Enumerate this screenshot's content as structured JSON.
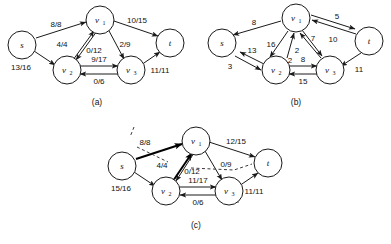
{
  "figure": {
    "panels": [
      {
        "id": "a",
        "caption": "(a)",
        "nodes": [
          {
            "id": "s",
            "label": "s",
            "sub": ""
          },
          {
            "id": "v1",
            "label": "v",
            "sub": "1"
          },
          {
            "id": "v2",
            "label": "v",
            "sub": "2"
          },
          {
            "id": "v3",
            "label": "v",
            "sub": "3"
          },
          {
            "id": "t",
            "label": "t",
            "sub": ""
          }
        ],
        "edges": [
          {
            "from": "s",
            "to": "v1",
            "label": "8/8",
            "style": "plain"
          },
          {
            "from": "s",
            "to": "v2",
            "label": "13/16",
            "style": "plain"
          },
          {
            "from": "v2",
            "to": "v1",
            "label": "4/4",
            "style": "plain"
          },
          {
            "from": "v1",
            "to": "v2",
            "label": "0/12",
            "style": "plain"
          },
          {
            "from": "v1",
            "to": "v3",
            "label": "2/9",
            "style": "plain"
          },
          {
            "from": "v1",
            "to": "t",
            "label": "10/15",
            "style": "plain"
          },
          {
            "from": "v2",
            "to": "v3",
            "label": "9/17",
            "style": "plain"
          },
          {
            "from": "v3",
            "to": "v2",
            "label": "0/6",
            "style": "plain"
          },
          {
            "from": "v3",
            "to": "t",
            "label": "11/11",
            "style": "plain"
          }
        ]
      },
      {
        "id": "b",
        "caption": "(b)",
        "nodes": [
          {
            "id": "s",
            "label": "s",
            "sub": ""
          },
          {
            "id": "v1",
            "label": "v",
            "sub": "1"
          },
          {
            "id": "v2",
            "label": "v",
            "sub": "2"
          },
          {
            "id": "v3",
            "label": "v",
            "sub": "3"
          },
          {
            "id": "t",
            "label": "t",
            "sub": ""
          }
        ],
        "edges": [
          {
            "from": "v1",
            "to": "s",
            "label": "8",
            "style": "plain"
          },
          {
            "from": "v2",
            "to": "s",
            "label": "13",
            "style": "plain"
          },
          {
            "from": "s",
            "to": "v2",
            "label": "3",
            "style": "plain"
          },
          {
            "from": "v1",
            "to": "v2",
            "label": "16",
            "style": "plain"
          },
          {
            "from": "v2",
            "to": "v1",
            "label": "2",
            "style": "plain"
          },
          {
            "from": "v3",
            "to": "v1",
            "label": "7",
            "style": "plain"
          },
          {
            "from": "v1",
            "to": "v3",
            "label": "2",
            "style": "plain"
          },
          {
            "from": "t",
            "to": "v1",
            "label": "10",
            "style": "plain"
          },
          {
            "from": "v1",
            "to": "t",
            "label": "5",
            "style": "plain"
          },
          {
            "from": "v2",
            "to": "v3",
            "label": "8",
            "style": "plain"
          },
          {
            "from": "v3",
            "to": "v2",
            "label": "15",
            "style": "plain"
          },
          {
            "from": "t",
            "to": "v3",
            "label": "11",
            "style": "plain"
          }
        ]
      },
      {
        "id": "c",
        "caption": "(c)",
        "nodes": [
          {
            "id": "s",
            "label": "s",
            "sub": ""
          },
          {
            "id": "v1",
            "label": "v",
            "sub": "1"
          },
          {
            "id": "v2",
            "label": "v",
            "sub": "2"
          },
          {
            "id": "v3",
            "label": "v",
            "sub": "3"
          },
          {
            "id": "t",
            "label": "t",
            "sub": ""
          }
        ],
        "edges": [
          {
            "from": "s",
            "to": "v1",
            "label": "8/8",
            "style": "bold"
          },
          {
            "from": "s",
            "to": "v2",
            "label": "15/16",
            "style": "plain"
          },
          {
            "from": "v2",
            "to": "v1",
            "label": "4/4",
            "style": "bold"
          },
          {
            "from": "v1",
            "to": "v2",
            "label": "0/12",
            "style": "plain"
          },
          {
            "from": "v1",
            "to": "v3",
            "label": "0/9",
            "style": "plain"
          },
          {
            "from": "v1",
            "to": "t",
            "label": "12/15",
            "style": "plain"
          },
          {
            "from": "v2",
            "to": "v3",
            "label": "11/17",
            "style": "plain"
          },
          {
            "from": "v3",
            "to": "v2",
            "label": "0/6",
            "style": "plain"
          },
          {
            "from": "v3",
            "to": "t",
            "label": "11/11",
            "style": "plain"
          }
        ],
        "annotations": [
          {
            "name": "augmenting-path-tick-left",
            "text": ""
          },
          {
            "name": "augmenting-path-dashes-mid",
            "text": ""
          },
          {
            "name": "augmenting-path-tick-right",
            "text": ""
          }
        ]
      }
    ]
  }
}
